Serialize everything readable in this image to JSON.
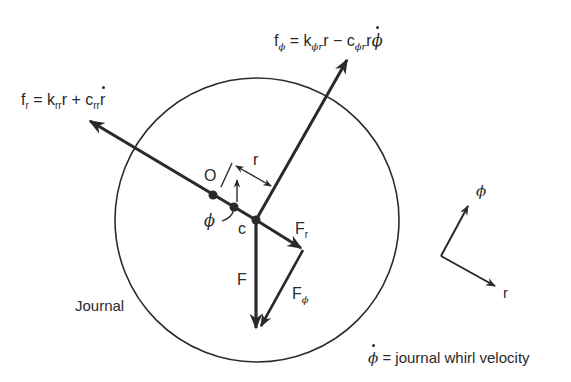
{
  "figure": {
    "type": "journal bearing force diagram",
    "labels": {
      "fr_eq": {
        "f": "f",
        "sub": "r",
        "eq": " = k",
        "k_sub": "rr",
        "r": "r + c",
        "c_sub": "rr",
        "rdot": "r"
      },
      "fphi_eq": {
        "f": "f",
        "sub": "ϕ",
        "eq": " = k",
        "k_sub": "ϕr",
        "r": "r − c",
        "c_sub": "ϕr",
        "tail": "r",
        "phidot": "ϕ"
      },
      "O": "O",
      "c": "c",
      "r": "r",
      "phi": "ϕ",
      "F": "F",
      "Fr": {
        "main": "F",
        "sub": "r"
      },
      "Fphi": {
        "main": "F",
        "sub": "ϕ"
      },
      "journal": "Journal",
      "axis_phi": "ϕ",
      "axis_r": "r",
      "legend": {
        "symbol": "ϕ",
        "text": " = journal whirl velocity"
      }
    },
    "colors": {
      "ink": "#2a2a2a",
      "background": "#ffffff"
    }
  }
}
